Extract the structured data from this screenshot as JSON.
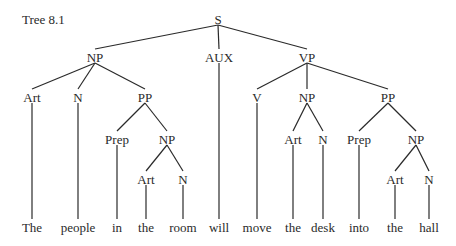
{
  "title": "Tree 8.1",
  "tree": {
    "nodes": [
      {
        "id": "S",
        "label": "S",
        "x": 218,
        "y": 20
      },
      {
        "id": "NP1",
        "label": "NP",
        "x": 95,
        "y": 58
      },
      {
        "id": "AUX",
        "label": "AUX",
        "x": 219,
        "y": 58
      },
      {
        "id": "VP",
        "label": "VP",
        "x": 307,
        "y": 58
      },
      {
        "id": "Art1",
        "label": "Art",
        "x": 32,
        "y": 98
      },
      {
        "id": "N1",
        "label": "N",
        "x": 78,
        "y": 98
      },
      {
        "id": "PP1",
        "label": "PP",
        "x": 145,
        "y": 98
      },
      {
        "id": "V",
        "label": "V",
        "x": 257,
        "y": 98
      },
      {
        "id": "NP3",
        "label": "NP",
        "x": 307,
        "y": 98
      },
      {
        "id": "PP2",
        "label": "PP",
        "x": 388,
        "y": 98
      },
      {
        "id": "Prep1",
        "label": "Prep",
        "x": 117,
        "y": 140
      },
      {
        "id": "NP2",
        "label": "NP",
        "x": 167,
        "y": 140
      },
      {
        "id": "Art3",
        "label": "Art",
        "x": 293,
        "y": 140
      },
      {
        "id": "N3",
        "label": "N",
        "x": 323,
        "y": 140
      },
      {
        "id": "Prep2",
        "label": "Prep",
        "x": 359,
        "y": 140
      },
      {
        "id": "NP4",
        "label": "NP",
        "x": 416,
        "y": 140
      },
      {
        "id": "Art2",
        "label": "Art",
        "x": 146,
        "y": 180
      },
      {
        "id": "N2",
        "label": "N",
        "x": 183,
        "y": 180
      },
      {
        "id": "Art4",
        "label": "Art",
        "x": 395,
        "y": 180
      },
      {
        "id": "N4",
        "label": "N",
        "x": 429,
        "y": 180
      },
      {
        "id": "w1",
        "label": "The",
        "x": 32,
        "y": 228,
        "word": true
      },
      {
        "id": "w2",
        "label": "people",
        "x": 78,
        "y": 228,
        "word": true
      },
      {
        "id": "w3",
        "label": "in",
        "x": 117,
        "y": 228,
        "word": true
      },
      {
        "id": "w4",
        "label": "the",
        "x": 146,
        "y": 228,
        "word": true
      },
      {
        "id": "w5",
        "label": "room",
        "x": 183,
        "y": 228,
        "word": true
      },
      {
        "id": "w6",
        "label": "will",
        "x": 219,
        "y": 228,
        "word": true
      },
      {
        "id": "w7",
        "label": "move",
        "x": 257,
        "y": 228,
        "word": true
      },
      {
        "id": "w8",
        "label": "the",
        "x": 293,
        "y": 228,
        "word": true
      },
      {
        "id": "w9",
        "label": "desk",
        "x": 323,
        "y": 228,
        "word": true
      },
      {
        "id": "w10",
        "label": "into",
        "x": 359,
        "y": 228,
        "word": true
      },
      {
        "id": "w11",
        "label": "the",
        "x": 395,
        "y": 228,
        "word": true
      },
      {
        "id": "w12",
        "label": "hall",
        "x": 429,
        "y": 228,
        "word": true
      }
    ],
    "edges": [
      [
        "S",
        "NP1"
      ],
      [
        "S",
        "AUX"
      ],
      [
        "S",
        "VP"
      ],
      [
        "NP1",
        "Art1"
      ],
      [
        "NP1",
        "N1"
      ],
      [
        "NP1",
        "PP1"
      ],
      [
        "PP1",
        "Prep1"
      ],
      [
        "PP1",
        "NP2"
      ],
      [
        "NP2",
        "Art2"
      ],
      [
        "NP2",
        "N2"
      ],
      [
        "VP",
        "V"
      ],
      [
        "VP",
        "NP3"
      ],
      [
        "VP",
        "PP2"
      ],
      [
        "NP3",
        "Art3"
      ],
      [
        "NP3",
        "N3"
      ],
      [
        "PP2",
        "Prep2"
      ],
      [
        "PP2",
        "NP4"
      ],
      [
        "NP4",
        "Art4"
      ],
      [
        "NP4",
        "N4"
      ],
      [
        "Art1",
        "w1"
      ],
      [
        "N1",
        "w2"
      ],
      [
        "Prep1",
        "w3"
      ],
      [
        "Art2",
        "w4"
      ],
      [
        "N2",
        "w5"
      ],
      [
        "AUX",
        "w6"
      ],
      [
        "V",
        "w7"
      ],
      [
        "Art3",
        "w8"
      ],
      [
        "N3",
        "w9"
      ],
      [
        "Prep2",
        "w10"
      ],
      [
        "Art4",
        "w11"
      ],
      [
        "N4",
        "w12"
      ]
    ]
  }
}
